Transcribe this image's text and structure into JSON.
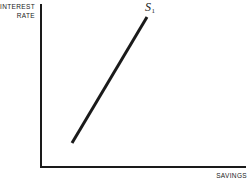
{
  "figure": {
    "background_color": "#ffffff",
    "ink_color": "#1a1a1a",
    "width": 251,
    "height": 190
  },
  "axes": {
    "y_axis_title": "INTEREST\nRATE",
    "x_axis_title": "SAVINGS"
  },
  "curve": {
    "label_letter": "S",
    "label_subscript": "1"
  },
  "chart_data": {
    "type": "line",
    "title": "",
    "subtitle": "",
    "xlabel": "SAVINGS",
    "ylabel": "INTEREST RATE",
    "xlim": [
      0,
      100
    ],
    "ylim": [
      0,
      100
    ],
    "grid": false,
    "legend": "none",
    "axis_ticks": {
      "x": [],
      "y": []
    },
    "series": [
      {
        "name": "S1",
        "annotation": "S₁",
        "annotation_position": "above-upper-endpoint",
        "description": "Upward sloping savings supply curve; savings rise as the interest rate rises",
        "x": [
          15.5,
          52.0
        ],
        "y": [
          14.0,
          91.5
        ],
        "line_width_px": 3,
        "color": "#1a1a1a",
        "endpoints_px": [
          [
            72,
            143
          ],
          [
            147,
            17
          ]
        ]
      }
    ]
  }
}
